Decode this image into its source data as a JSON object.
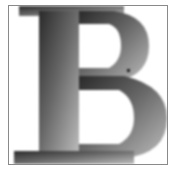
{
  "image": {
    "letter": "B",
    "description": "Pixelated gradient-shaded capital letter B in a bordered box",
    "colors": {
      "border": "#8a8a8a",
      "background": "#ffffff",
      "gradient_dark": "#2e2e2e",
      "gradient_mid": "#6e6e6e",
      "gradient_light": "#b4b4b4"
    }
  }
}
